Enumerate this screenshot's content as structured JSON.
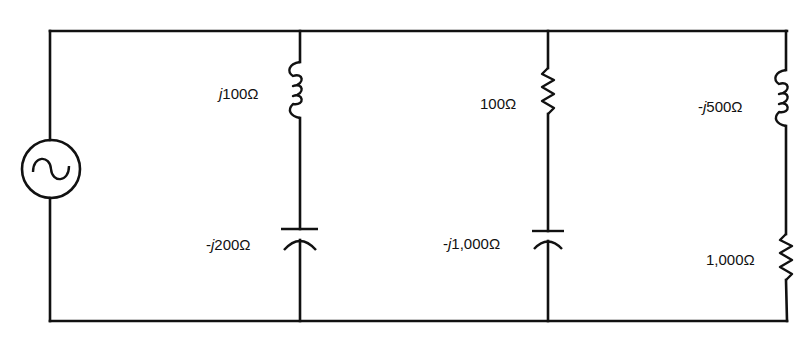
{
  "diagram": {
    "type": "AC parallel circuit",
    "colors": {
      "stroke": "#111111",
      "background": "#ffffff"
    },
    "source": {
      "symbol": "ac-voltage-source",
      "glyph": "~"
    },
    "branches": [
      {
        "id": "branch-1",
        "components": [
          {
            "type": "inductor",
            "prefix": "",
            "j": "j",
            "value": "100Ω"
          },
          {
            "type": "capacitor",
            "prefix": "-",
            "j": "j",
            "value": "200Ω"
          }
        ]
      },
      {
        "id": "branch-2",
        "components": [
          {
            "type": "resistor",
            "prefix": "",
            "j": "",
            "value": "100Ω"
          },
          {
            "type": "capacitor",
            "prefix": "-",
            "j": "j",
            "value": "1,000Ω"
          }
        ]
      },
      {
        "id": "branch-3",
        "components": [
          {
            "type": "inductor",
            "prefix": "-",
            "j": "j",
            "value": "500Ω"
          },
          {
            "type": "resistor",
            "prefix": "",
            "j": "",
            "value": "1,000Ω"
          }
        ]
      }
    ]
  }
}
